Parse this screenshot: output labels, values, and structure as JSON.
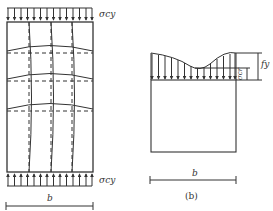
{
  "figure_a": {
    "caption": "(a)",
    "top_stress_label": "σcy",
    "bottom_stress_label": "σcy",
    "width_label": "b",
    "arrow_count": 14
  },
  "figure_b": {
    "caption": "(b)",
    "stress_label": "σcr",
    "peak_stress_label": "fy",
    "width_label": "b",
    "arrow_count": 14
  },
  "colors": {
    "line": "#333333",
    "background": "#ffffff"
  }
}
